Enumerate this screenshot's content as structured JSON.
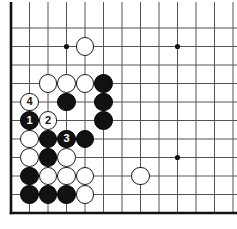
{
  "diagram": {
    "kind": "go-board-diagram",
    "board": {
      "width_px": 237,
      "height_px": 229,
      "origin_x": 11,
      "origin_y": 28,
      "spacing": 18.5,
      "cols": 13,
      "rows": 11,
      "line_color": "#555555",
      "line_width": 1,
      "border_color": "#111111",
      "border_width": 2.6,
      "background_color": "#ffffff",
      "edges": {
        "left": true,
        "bottom": true,
        "top": false,
        "right": false
      },
      "grid_visible": true
    },
    "star_points": [
      {
        "col": 3,
        "row": 1
      },
      {
        "col": 9,
        "row": 1
      },
      {
        "col": 9,
        "row": 7
      }
    ],
    "star_point_radius": 2.6,
    "stone_radius": 9.4,
    "colors": {
      "black": "#111111",
      "white": "#ffffff",
      "black_outline": "#000000",
      "white_outline": "#1a1a1a",
      "black_label": "#ffffff",
      "white_label": "#111111"
    },
    "stones": [
      {
        "id": "w-d17",
        "color": "white",
        "col": 4,
        "row": 1,
        "label": ""
      },
      {
        "id": "w-c14",
        "color": "white",
        "col": 2,
        "row": 3,
        "label": ""
      },
      {
        "id": "w-d14",
        "color": "white",
        "col": 3,
        "row": 3,
        "label": ""
      },
      {
        "id": "w-e14",
        "color": "white",
        "col": 4,
        "row": 3,
        "label": ""
      },
      {
        "id": "b-f14",
        "color": "black",
        "col": 5,
        "row": 3,
        "label": ""
      },
      {
        "id": "w-b13",
        "color": "white",
        "col": 1,
        "row": 4,
        "label": "4"
      },
      {
        "id": "b-d13",
        "color": "black",
        "col": 3,
        "row": 4,
        "label": ""
      },
      {
        "id": "b-f13",
        "color": "black",
        "col": 5,
        "row": 4,
        "label": ""
      },
      {
        "id": "b-b12",
        "color": "black",
        "col": 1,
        "row": 5,
        "label": "1"
      },
      {
        "id": "w-c12",
        "color": "white",
        "col": 2,
        "row": 5,
        "label": "2"
      },
      {
        "id": "b-f12",
        "color": "black",
        "col": 5,
        "row": 5,
        "label": ""
      },
      {
        "id": "w-b11",
        "color": "white",
        "col": 1,
        "row": 6,
        "label": ""
      },
      {
        "id": "b-c11",
        "color": "black",
        "col": 2,
        "row": 6,
        "label": ""
      },
      {
        "id": "b-d11",
        "color": "black",
        "col": 3,
        "row": 6,
        "label": "3"
      },
      {
        "id": "b-e11",
        "color": "black",
        "col": 4,
        "row": 6,
        "label": ""
      },
      {
        "id": "w-b10",
        "color": "white",
        "col": 1,
        "row": 7,
        "label": ""
      },
      {
        "id": "b-c10",
        "color": "black",
        "col": 2,
        "row": 7,
        "label": ""
      },
      {
        "id": "w-d10",
        "color": "white",
        "col": 3,
        "row": 7,
        "label": ""
      },
      {
        "id": "w-h10",
        "color": "white",
        "col": 7,
        "row": 8,
        "label": ""
      },
      {
        "id": "b-a9",
        "color": "black",
        "col": 1,
        "row": 8,
        "label": ""
      },
      {
        "id": "w-c9",
        "color": "white",
        "col": 2,
        "row": 8,
        "label": ""
      },
      {
        "id": "w-d9",
        "color": "white",
        "col": 3,
        "row": 8,
        "label": ""
      },
      {
        "id": "w-e9",
        "color": "white",
        "col": 4,
        "row": 8,
        "label": ""
      },
      {
        "id": "b-a8",
        "color": "black",
        "col": 1,
        "row": 9,
        "label": ""
      },
      {
        "id": "b-c8",
        "color": "black",
        "col": 2,
        "row": 9,
        "label": ""
      },
      {
        "id": "b-d8",
        "color": "black",
        "col": 3,
        "row": 9,
        "label": ""
      },
      {
        "id": "w-e8",
        "color": "white",
        "col": 4,
        "row": 9,
        "label": ""
      }
    ],
    "move_sequence": [
      {
        "number": "1",
        "color": "black"
      },
      {
        "number": "2",
        "color": "white"
      },
      {
        "number": "3",
        "color": "black"
      },
      {
        "number": "4",
        "color": "white"
      }
    ]
  }
}
